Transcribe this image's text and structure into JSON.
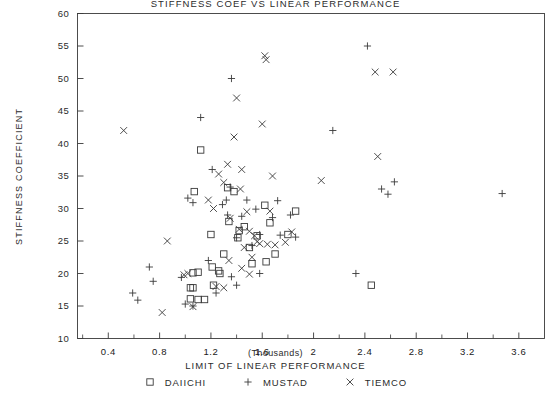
{
  "chart_data": {
    "type": "scatter",
    "title": "STIFFNESS COEF VS LINEAR PERFORMANCE",
    "xlabel": "LIMIT OF LINEAR PERFORMANCE",
    "xunits": "(Thousands)",
    "ylabel": "STIFFNESS COEFFICIENT",
    "xlim": [
      0.16,
      3.8
    ],
    "ylim": [
      10,
      60
    ],
    "xticks": [
      0.4,
      0.8,
      1.2,
      1.6,
      2.0,
      2.4,
      2.8,
      3.2,
      3.6
    ],
    "xtick_labels": [
      "0.4",
      "0.8",
      "1.2",
      "1.6",
      "2",
      "2.4",
      "2.8",
      "3.2",
      "3.6"
    ],
    "yticks": [
      10,
      15,
      20,
      25,
      30,
      35,
      40,
      45,
      50,
      55,
      60
    ],
    "ytick_labels": [
      "10",
      "15",
      "20",
      "25",
      "30",
      "35",
      "40",
      "45",
      "50",
      "55",
      "60"
    ],
    "grid": false,
    "legend_position": "bottom",
    "series": [
      {
        "name": "DAIICHI",
        "marker": "square",
        "points": [
          [
            1.07,
            32.6
          ],
          [
            1.12,
            39.0
          ],
          [
            1.1,
            20.2
          ],
          [
            1.06,
            20.1
          ],
          [
            1.04,
            17.8
          ],
          [
            1.06,
            17.8
          ],
          [
            1.04,
            16.1
          ],
          [
            1.1,
            16.0
          ],
          [
            1.15,
            16.0
          ],
          [
            1.2,
            26.0
          ],
          [
            1.22,
            18.2
          ],
          [
            1.3,
            23.0
          ],
          [
            1.33,
            33.2
          ],
          [
            1.38,
            32.6
          ],
          [
            1.34,
            28.0
          ],
          [
            1.41,
            25.5
          ],
          [
            1.46,
            27.2
          ],
          [
            1.5,
            24.0
          ],
          [
            1.52,
            21.5
          ],
          [
            1.56,
            25.8
          ],
          [
            1.42,
            26.6
          ],
          [
            1.62,
            30.5
          ],
          [
            1.66,
            27.8
          ],
          [
            1.7,
            23.0
          ],
          [
            1.63,
            21.8
          ],
          [
            1.8,
            26.0
          ],
          [
            1.86,
            29.6
          ],
          [
            2.45,
            18.2
          ],
          [
            1.26,
            20.4
          ],
          [
            1.27,
            20.0
          ],
          [
            1.21,
            21.0
          ]
        ]
      },
      {
        "name": "MUSTAD",
        "marker": "plus",
        "points": [
          [
            0.59,
            17.0
          ],
          [
            0.63,
            15.9
          ],
          [
            0.72,
            21.0
          ],
          [
            0.75,
            18.8
          ],
          [
            0.97,
            19.4
          ],
          [
            1.02,
            31.6
          ],
          [
            1.06,
            30.9
          ],
          [
            1.0,
            15.3
          ],
          [
            1.06,
            15.0
          ],
          [
            1.12,
            44.0
          ],
          [
            1.21,
            36.0
          ],
          [
            1.29,
            30.6
          ],
          [
            1.32,
            31.3
          ],
          [
            1.35,
            33.3
          ],
          [
            1.36,
            50.0
          ],
          [
            1.33,
            29.0
          ],
          [
            1.4,
            25.5
          ],
          [
            1.44,
            28.8
          ],
          [
            1.48,
            31.3
          ],
          [
            1.52,
            24.3
          ],
          [
            1.55,
            29.9
          ],
          [
            1.58,
            26.0
          ],
          [
            1.68,
            28.6
          ],
          [
            1.72,
            31.2
          ],
          [
            1.74,
            25.9
          ],
          [
            1.82,
            29.0
          ],
          [
            1.86,
            25.6
          ],
          [
            1.58,
            20.0
          ],
          [
            1.36,
            19.5
          ],
          [
            1.4,
            18.2
          ],
          [
            2.15,
            42.0
          ],
          [
            2.33,
            20.0
          ],
          [
            2.42,
            55.0
          ],
          [
            2.53,
            33.0
          ],
          [
            2.63,
            34.1
          ],
          [
            2.58,
            32.2
          ],
          [
            3.47,
            32.3
          ],
          [
            1.18,
            22.0
          ],
          [
            1.24,
            17.0
          ]
        ]
      },
      {
        "name": "TIEMCO",
        "marker": "cross",
        "points": [
          [
            0.52,
            42.0
          ],
          [
            0.82,
            14.0
          ],
          [
            0.86,
            25.0
          ],
          [
            1.02,
            20.0
          ],
          [
            1.06,
            14.9
          ],
          [
            1.18,
            31.3
          ],
          [
            1.22,
            30.0
          ],
          [
            1.26,
            35.3
          ],
          [
            1.3,
            34.0
          ],
          [
            1.33,
            36.8
          ],
          [
            1.38,
            41.0
          ],
          [
            1.4,
            47.0
          ],
          [
            1.35,
            28.5
          ],
          [
            1.44,
            36.0
          ],
          [
            1.43,
            33.0
          ],
          [
            1.48,
            29.5
          ],
          [
            1.42,
            26.8
          ],
          [
            1.46,
            24.0
          ],
          [
            1.5,
            26.5
          ],
          [
            1.52,
            22.5
          ],
          [
            1.54,
            25.8
          ],
          [
            1.56,
            24.9
          ],
          [
            1.58,
            24.6
          ],
          [
            1.62,
            53.5
          ],
          [
            1.63,
            52.9
          ],
          [
            1.6,
            43.0
          ],
          [
            1.64,
            24.5
          ],
          [
            1.68,
            35.0
          ],
          [
            1.7,
            24.4
          ],
          [
            1.78,
            24.8
          ],
          [
            1.83,
            26.4
          ],
          [
            1.44,
            20.8
          ],
          [
            1.5,
            19.9
          ],
          [
            2.06,
            34.3
          ],
          [
            2.48,
            51.0
          ],
          [
            2.5,
            38.0
          ],
          [
            2.62,
            51.0
          ],
          [
            1.24,
            18.0
          ],
          [
            1.3,
            17.8
          ],
          [
            0.99,
            19.8
          ],
          [
            1.34,
            22.0
          ],
          [
            1.66,
            29.6
          ]
        ]
      }
    ]
  }
}
